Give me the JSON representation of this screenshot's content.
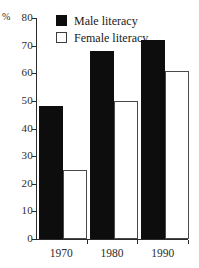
{
  "chart_data": {
    "type": "bar",
    "title": "",
    "xlabel": "",
    "ylabel": "%",
    "categories": [
      "1970",
      "1980",
      "1990"
    ],
    "series": [
      {
        "name": "Male literacy",
        "values": [
          48,
          68,
          72
        ],
        "color": "#0d0d0d"
      },
      {
        "name": "Female literacy",
        "values": [
          25,
          50,
          61
        ],
        "color": "#ffffff"
      }
    ],
    "ylim": [
      0,
      80
    ],
    "yticks": [
      0,
      10,
      20,
      30,
      40,
      50,
      60,
      70,
      80
    ],
    "ytick_labels": [
      "0",
      "10",
      "20",
      "30",
      "40",
      "50",
      "60",
      "70",
      "80"
    ],
    "grid": false,
    "legend_position": "top-right"
  },
  "axis": {
    "percent_symbol": "%",
    "y_unit_label": "%"
  },
  "legend": {
    "items": [
      {
        "label": "Male literacy",
        "swatch": "filled-square",
        "color": "#0d0d0d"
      },
      {
        "label": "Female literacy",
        "swatch": "outline-square",
        "color": "#ffffff"
      }
    ]
  }
}
